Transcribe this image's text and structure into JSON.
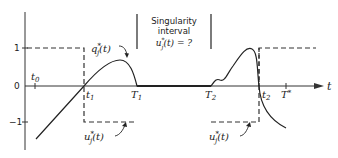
{
  "diagram": {
    "type": "optimal-control-switching-diagram",
    "annotation": {
      "line1": "Singularity",
      "line2": "interval",
      "line3": "u*j(t) = ?"
    },
    "y_axis": {
      "ticks": [
        {
          "label": "1",
          "value": 1
        },
        {
          "label": "0",
          "value": 0
        },
        {
          "label": "−1",
          "value": -1
        }
      ]
    },
    "x_axis": {
      "label": "t",
      "time_marks": [
        {
          "id": "t0",
          "label": "t",
          "sub": "0"
        },
        {
          "id": "t1",
          "label": "t",
          "sub": "1"
        },
        {
          "id": "T1",
          "label": "T",
          "sub": "1"
        },
        {
          "id": "T2",
          "label": "T",
          "sub": "2"
        },
        {
          "id": "t2",
          "label": "t",
          "sub": "2"
        },
        {
          "id": "Tstar",
          "label": "T",
          "sup": "*"
        }
      ]
    },
    "curves": {
      "q_label": "q",
      "q_sup": "*",
      "q_sub": "j",
      "q_arg": "(t)",
      "u_label": "u",
      "u_sup": "*",
      "u_sub": "j",
      "u_arg": "(t)"
    }
  }
}
